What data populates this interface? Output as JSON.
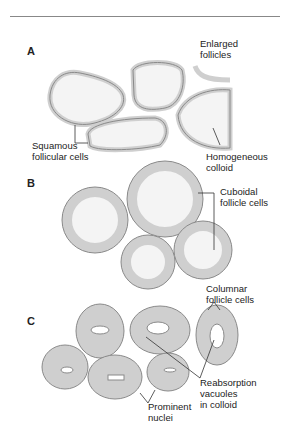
{
  "panels": [
    {
      "letter": "A",
      "labels": {
        "top": "Enlarged\nfollicles",
        "left": "Squamous\nfollicular cells",
        "right": "Homogeneous\ncolloid"
      }
    },
    {
      "letter": "B",
      "labels": {
        "right": "Cuboidal\nfollicle cells"
      }
    },
    {
      "letter": "C",
      "labels": {
        "top": "Columnar\nfollicle cells",
        "right": "Reabsorption\nvacuoles\nin colloid",
        "bottom": "Prominent\nnuclei"
      }
    }
  ],
  "colors": {
    "membrane": "#cfcfcf",
    "outline": "#8a8a8a",
    "colloid": "#f4f4f4",
    "leader": "#333333"
  }
}
